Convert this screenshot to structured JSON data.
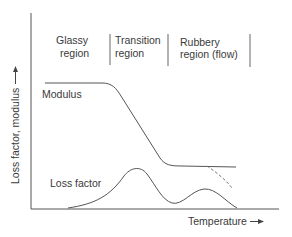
{
  "diagram": {
    "type": "viscoelastic-regions",
    "regions": [
      {
        "line1": "Glassy",
        "line2": "region"
      },
      {
        "line1": "Transition",
        "line2": "region"
      },
      {
        "line1": "Rubbery",
        "line2": "region (flow)"
      }
    ],
    "curves": {
      "modulus_label": "Modulus",
      "loss_factor_label": "Loss factor"
    },
    "axes": {
      "y_label": "Loss factor, modulus",
      "x_label": "Temperature"
    },
    "colors": {
      "line": "#555555",
      "text": "#3a3a3a",
      "dashed": "#777777"
    }
  }
}
